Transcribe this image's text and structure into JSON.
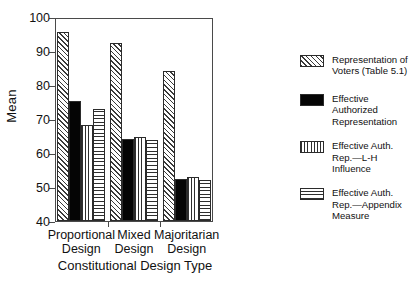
{
  "chart_data": {
    "type": "bar",
    "title": "",
    "xlabel": "Constitutional Design Type",
    "ylabel": "Mean",
    "ylim": [
      40,
      100
    ],
    "yticks": [
      40,
      50,
      60,
      70,
      80,
      90,
      100
    ],
    "grid": false,
    "legend_position": "right",
    "categories": [
      "Proportional Design",
      "Mixed Design",
      "Majoritarian Design"
    ],
    "series": [
      {
        "name": "Representation of Voters (Table 5.1)",
        "pattern": "diagonal-hatch",
        "values": [
          95.5,
          92.3,
          84.0
        ]
      },
      {
        "name": "Effective Authorized Representation",
        "pattern": "solid-black",
        "values": [
          75.4,
          64.2,
          52.5
        ]
      },
      {
        "name": "Effective Auth. Rep.—L-H Influence",
        "pattern": "vertical-lines",
        "values": [
          68.2,
          64.7,
          52.8
        ]
      },
      {
        "name": "Effective Auth. Rep.—Appendix Measure",
        "pattern": "horizontal-lines",
        "values": [
          72.8,
          63.8,
          52.2
        ]
      }
    ]
  },
  "axes": {
    "y_title": "Mean",
    "x_title": "Constitutional Design Type",
    "y_tick_labels": [
      "100",
      "90",
      "80",
      "70",
      "60",
      "50",
      "40"
    ],
    "x_tick_labels": [
      {
        "line1": "Proportional",
        "line2": "Design"
      },
      {
        "line1": "Mixed",
        "line2": "Design"
      },
      {
        "line1": "Majoritarian",
        "line2": "Design"
      }
    ]
  },
  "legend": {
    "entries": [
      {
        "line1": "Representation of",
        "line2": "Voters (Table 5.1)",
        "line3": ""
      },
      {
        "line1": "Effective Authorized",
        "line2": "Representation",
        "line3": ""
      },
      {
        "line1": "Effective Auth.",
        "line2": "Rep.—L-H Influence",
        "line3": ""
      },
      {
        "line1": "Effective Auth.",
        "line2": "Rep.—Appendix",
        "line3": "Measure"
      }
    ]
  },
  "colors": {
    "axis": "#4a4a4a",
    "ink": "#111111",
    "fill_solid": "#050505",
    "background": "#ffffff"
  }
}
